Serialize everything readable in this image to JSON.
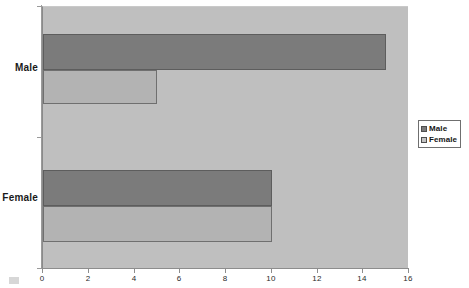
{
  "chart_data": {
    "type": "bar",
    "orientation": "horizontal",
    "title": "",
    "xlabel": "",
    "ylabel": "",
    "categories": [
      "Male",
      "Female"
    ],
    "series": [
      {
        "name": "Male",
        "values": [
          15,
          10
        ],
        "color": "#7b7b7b"
      },
      {
        "name": "Female",
        "values": [
          5,
          10
        ],
        "color": "#b3b3b3"
      }
    ],
    "xlim": [
      0,
      16
    ],
    "xticks": [
      0,
      2,
      4,
      6,
      8,
      10,
      12,
      14,
      16
    ],
    "xtick_labels": [
      "0",
      "2",
      "4",
      "6",
      "8",
      "10",
      "12",
      "14",
      "16"
    ],
    "grid": false,
    "legend_position": "right",
    "plot_background": "#bfbfbf",
    "page_background": "#ffffff"
  },
  "legend": {
    "items": [
      {
        "label": "Male"
      },
      {
        "label": "Female"
      }
    ]
  },
  "axes": {
    "category_labels": [
      {
        "label": "Male"
      },
      {
        "label": "Female"
      }
    ]
  }
}
